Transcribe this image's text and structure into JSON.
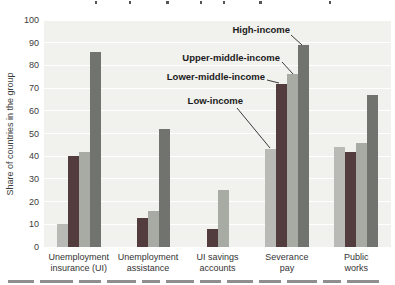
{
  "chart_data": {
    "type": "bar",
    "ylabel": "Share of countries in the group",
    "ylim": [
      0,
      100
    ],
    "yticks": [
      0,
      10,
      20,
      30,
      40,
      50,
      60,
      70,
      80,
      90,
      100
    ],
    "grid": "horizontal white gridlines on light gray plot background",
    "legend_position": "in-plot annotation labels with leader lines",
    "categories": [
      [
        "Unemployment",
        "insurance (UI)"
      ],
      [
        "Unemployment",
        "assistance"
      ],
      [
        "UI savings",
        "accounts"
      ],
      [
        "Severance",
        "pay"
      ],
      [
        "Public",
        "works"
      ]
    ],
    "series": [
      {
        "name": "Low-income",
        "color": "#b9bab5",
        "values": [
          10,
          0,
          0,
          43,
          44
        ]
      },
      {
        "name": "Lower-middle-income",
        "color": "#523c3d",
        "values": [
          40,
          13,
          8,
          72,
          42
        ]
      },
      {
        "name": "Upper-middle-income",
        "color": "#a7aba3",
        "values": [
          42,
          16,
          25,
          76,
          46
        ]
      },
      {
        "name": "High-income",
        "color": "#70736e",
        "values": [
          86,
          52,
          0,
          89,
          67
        ]
      }
    ],
    "annotations": [
      "High-income",
      "Upper-middle-income",
      "Lower-middle-income",
      "Low-income"
    ],
    "cropped_text": {
      "top": "figure title cut off at top edge (only letter descenders visible, illegible)",
      "bottom": "caption line cut off at bottom edge (only letter tops visible, illegible)"
    }
  }
}
